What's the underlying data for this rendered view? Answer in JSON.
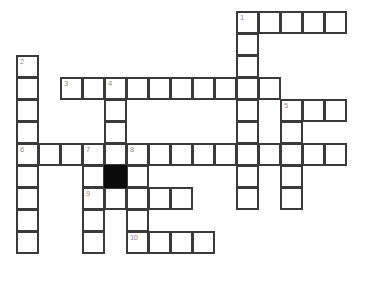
{
  "puzzle": {
    "title": "Crossword Grid",
    "grid": {
      "origin_x": 16,
      "origin_y": 11,
      "cell_size": 22,
      "cell_box": 23,
      "border_color": "#3a3a3a",
      "blocked_color": "#0b0b0b",
      "background": "#ffffff",
      "number_color": "#8d8d8d"
    },
    "entry_numbers": [
      "1",
      "2",
      "3",
      "4",
      "5",
      "6",
      "7",
      "8",
      "9",
      "10"
    ],
    "blocked_cells": [
      {
        "col": 4,
        "row": 7
      }
    ],
    "cells": [
      {
        "col": 10,
        "row": 0,
        "num": "1",
        "letter": ""
      },
      {
        "col": 11,
        "row": 0,
        "num": "",
        "letter": ""
      },
      {
        "col": 12,
        "row": 0,
        "num": "",
        "letter": ""
      },
      {
        "col": 13,
        "row": 0,
        "num": "",
        "letter": ""
      },
      {
        "col": 14,
        "row": 0,
        "num": "",
        "letter": ""
      },
      {
        "col": 10,
        "row": 1,
        "num": "",
        "letter": ""
      },
      {
        "col": 0,
        "row": 2,
        "num": "2",
        "letter": ""
      },
      {
        "col": 10,
        "row": 2,
        "num": "",
        "letter": ""
      },
      {
        "col": 0,
        "row": 3,
        "num": "",
        "letter": ""
      },
      {
        "col": 2,
        "row": 3,
        "num": "3",
        "letter": ""
      },
      {
        "col": 3,
        "row": 3,
        "num": "",
        "letter": ""
      },
      {
        "col": 4,
        "row": 3,
        "num": "4",
        "letter": ""
      },
      {
        "col": 5,
        "row": 3,
        "num": "",
        "letter": ""
      },
      {
        "col": 6,
        "row": 3,
        "num": "",
        "letter": ""
      },
      {
        "col": 7,
        "row": 3,
        "num": "",
        "letter": ""
      },
      {
        "col": 8,
        "row": 3,
        "num": "",
        "letter": ""
      },
      {
        "col": 9,
        "row": 3,
        "num": "",
        "letter": ""
      },
      {
        "col": 10,
        "row": 3,
        "num": "",
        "letter": ""
      },
      {
        "col": 11,
        "row": 3,
        "num": "",
        "letter": ""
      },
      {
        "col": 0,
        "row": 4,
        "num": "",
        "letter": ""
      },
      {
        "col": 4,
        "row": 4,
        "num": "",
        "letter": ""
      },
      {
        "col": 10,
        "row": 4,
        "num": "",
        "letter": ""
      },
      {
        "col": 12,
        "row": 4,
        "num": "5",
        "letter": ""
      },
      {
        "col": 13,
        "row": 4,
        "num": "",
        "letter": ""
      },
      {
        "col": 14,
        "row": 4,
        "num": "",
        "letter": ""
      },
      {
        "col": 0,
        "row": 5,
        "num": "",
        "letter": ""
      },
      {
        "col": 4,
        "row": 5,
        "num": "",
        "letter": ""
      },
      {
        "col": 10,
        "row": 5,
        "num": "",
        "letter": ""
      },
      {
        "col": 12,
        "row": 5,
        "num": "",
        "letter": ""
      },
      {
        "col": 0,
        "row": 6,
        "num": "6",
        "letter": ""
      },
      {
        "col": 1,
        "row": 6,
        "num": "",
        "letter": ""
      },
      {
        "col": 2,
        "row": 6,
        "num": "",
        "letter": ""
      },
      {
        "col": 3,
        "row": 6,
        "num": "7",
        "letter": ""
      },
      {
        "col": 4,
        "row": 6,
        "num": "",
        "letter": ""
      },
      {
        "col": 5,
        "row": 6,
        "num": "8",
        "letter": ""
      },
      {
        "col": 6,
        "row": 6,
        "num": "",
        "letter": ""
      },
      {
        "col": 7,
        "row": 6,
        "num": "",
        "letter": ""
      },
      {
        "col": 8,
        "row": 6,
        "num": "",
        "letter": ""
      },
      {
        "col": 9,
        "row": 6,
        "num": "",
        "letter": ""
      },
      {
        "col": 10,
        "row": 6,
        "num": "",
        "letter": ""
      },
      {
        "col": 11,
        "row": 6,
        "num": "",
        "letter": ""
      },
      {
        "col": 12,
        "row": 6,
        "num": "",
        "letter": ""
      },
      {
        "col": 13,
        "row": 6,
        "num": "",
        "letter": ""
      },
      {
        "col": 14,
        "row": 6,
        "num": "",
        "letter": ""
      },
      {
        "col": 0,
        "row": 7,
        "num": "",
        "letter": ""
      },
      {
        "col": 3,
        "row": 7,
        "num": "",
        "letter": ""
      },
      {
        "col": 5,
        "row": 7,
        "num": "",
        "letter": ""
      },
      {
        "col": 10,
        "row": 7,
        "num": "",
        "letter": ""
      },
      {
        "col": 12,
        "row": 7,
        "num": "",
        "letter": ""
      },
      {
        "col": 0,
        "row": 8,
        "num": "",
        "letter": ""
      },
      {
        "col": 3,
        "row": 8,
        "num": "9",
        "letter": ""
      },
      {
        "col": 4,
        "row": 8,
        "num": "",
        "letter": ""
      },
      {
        "col": 5,
        "row": 8,
        "num": "",
        "letter": ""
      },
      {
        "col": 6,
        "row": 8,
        "num": "",
        "letter": ""
      },
      {
        "col": 7,
        "row": 8,
        "num": "",
        "letter": ""
      },
      {
        "col": 10,
        "row": 8,
        "num": "",
        "letter": ""
      },
      {
        "col": 12,
        "row": 8,
        "num": "",
        "letter": ""
      },
      {
        "col": 0,
        "row": 9,
        "num": "",
        "letter": ""
      },
      {
        "col": 3,
        "row": 9,
        "num": "",
        "letter": ""
      },
      {
        "col": 5,
        "row": 9,
        "num": "",
        "letter": ""
      },
      {
        "col": 0,
        "row": 10,
        "num": "",
        "letter": ""
      },
      {
        "col": 3,
        "row": 10,
        "num": "",
        "letter": ""
      },
      {
        "col": 5,
        "row": 10,
        "num": "10",
        "letter": ""
      },
      {
        "col": 6,
        "row": 10,
        "num": "",
        "letter": ""
      },
      {
        "col": 7,
        "row": 10,
        "num": "",
        "letter": ""
      },
      {
        "col": 8,
        "row": 10,
        "num": "",
        "letter": ""
      }
    ]
  }
}
